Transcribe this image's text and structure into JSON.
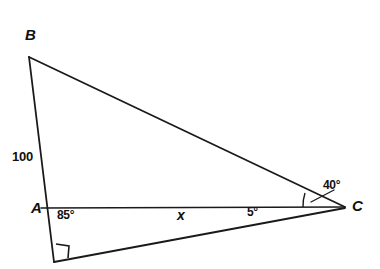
{
  "figure": {
    "type": "geometry-diagram",
    "background_color": "#ffffff",
    "stroke_color": "#1a1a1a",
    "text_color": "#111111",
    "vertices": [
      {
        "name": "B",
        "label": "B",
        "x": 29,
        "y": 57
      },
      {
        "name": "A",
        "label": "A",
        "x": 49,
        "y": 208
      },
      {
        "name": "C",
        "label": "C",
        "x": 345,
        "y": 207
      },
      {
        "name": "D",
        "label": "",
        "x": 54,
        "y": 262
      }
    ],
    "segments": [
      {
        "name": "segment-BA-AD",
        "from": "B",
        "to": "D"
      },
      {
        "name": "segment-BC",
        "from": "B",
        "to": "C"
      },
      {
        "name": "segment-AC",
        "from": "A",
        "to": "C"
      },
      {
        "name": "segment-DC",
        "from": "D",
        "to": "C"
      }
    ],
    "labels": {
      "vertex_b": "B",
      "vertex_a": "A",
      "vertex_c": "C",
      "side_ab": "100",
      "angle_a": "85°",
      "side_ac": "x",
      "angle_c_lower": "5°",
      "angle_c_upper": "40°"
    },
    "markers": {
      "right_angle_at_d": "right-angle-square",
      "angle_arc_at_c": "arc"
    }
  }
}
